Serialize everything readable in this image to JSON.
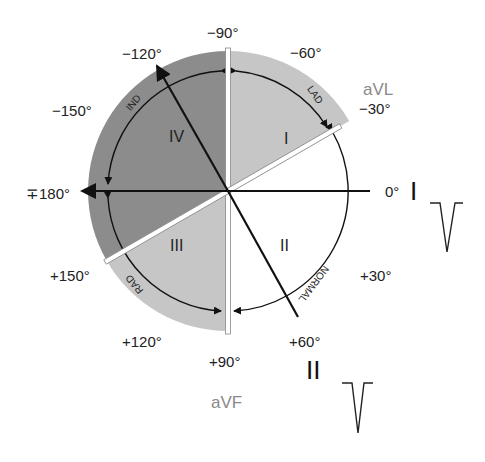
{
  "diagram": {
    "center": [
      228,
      191
    ],
    "colors": {
      "dark_region": "#8c8c8c",
      "light_region": "#c6c6c6",
      "normal_region": "#ffffff",
      "lead_lines": "#111111",
      "white_bars": "#ffffff",
      "lead_label_gray": "#8a8a8a"
    },
    "angle_labels": [
      {
        "id": "m90",
        "text": "−90°"
      },
      {
        "id": "m60",
        "text": "−60°"
      },
      {
        "id": "m30",
        "text": "−30°"
      },
      {
        "id": "m120",
        "text": "−120°"
      },
      {
        "id": "m150",
        "text": "−150°"
      },
      {
        "id": "p180",
        "text": "∓180°"
      },
      {
        "id": "zero",
        "text": "0°"
      },
      {
        "id": "p30",
        "text": "+30°"
      },
      {
        "id": "p60",
        "text": "+60°"
      },
      {
        "id": "p90",
        "text": "+90°"
      },
      {
        "id": "p120",
        "text": "+120°"
      },
      {
        "id": "p150",
        "text": "+150°"
      }
    ],
    "quadrants": [
      {
        "id": "I",
        "text": "I"
      },
      {
        "id": "II",
        "text": "II"
      },
      {
        "id": "III",
        "text": "III"
      },
      {
        "id": "IV",
        "text": "IV"
      }
    ],
    "arc_labels": {
      "lad": "LAD",
      "ind": "IND",
      "rad": "RAD",
      "normal": "NORMAL"
    },
    "leads": {
      "avl": "aVL",
      "avf": "aVF",
      "lead_I": "I",
      "lead_II": "II"
    }
  }
}
